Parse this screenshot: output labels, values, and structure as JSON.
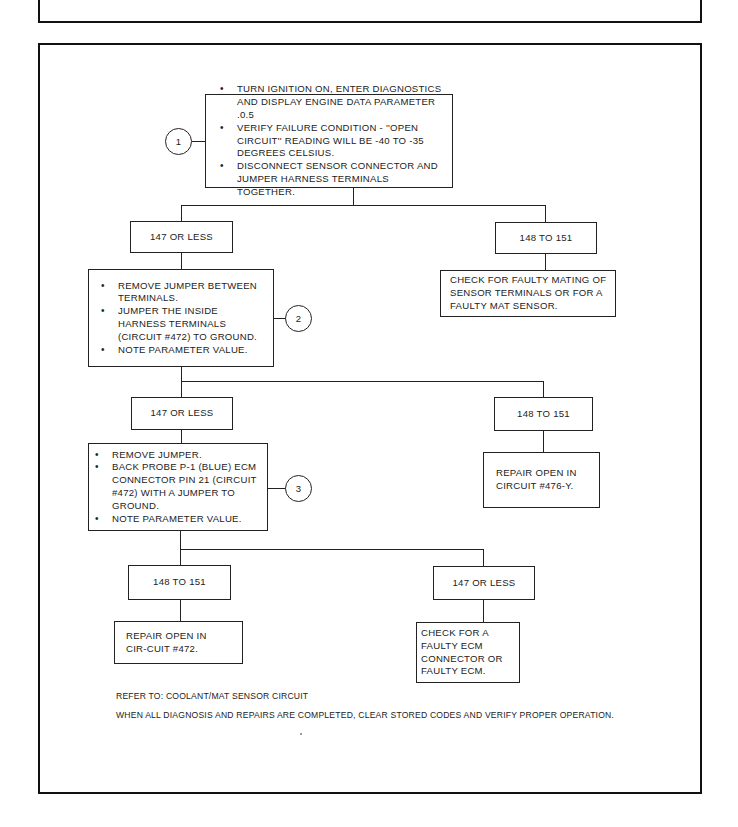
{
  "header": {
    "title": "OPEN MAT SENSOR CIRCUIT"
  },
  "steps": {
    "step1": {
      "number": "1",
      "bullets": [
        "TURN IGNITION ON, ENTER DIAGNOSTICS AND DISPLAY ENGINE DATA PARAMETER .0.5",
        "VERIFY FAILURE CONDITION - ''OPEN CIRCUIT'' READING WILL BE -40 TO -35 DEGREES CELSIUS.",
        "DISCONNECT SENSOR CONNECTOR AND JUMPER HARNESS TERMINALS TOGETHER."
      ]
    },
    "step2": {
      "number": "2",
      "bullets": [
        "REMOVE JUMPER BETWEEN TERMINALS.",
        "JUMPER THE INSIDE HARNESS TERMINALS (CIRCUIT #472) TO GROUND.",
        "NOTE PARAMETER VALUE."
      ]
    },
    "step3": {
      "number": "3",
      "bullets": [
        "REMOVE JUMPER.",
        "BACK PROBE P-1 (BLUE) ECM CONNECTOR PIN 21 (CIRCUIT #472) WITH A JUMPER TO GROUND.",
        "NOTE PARAMETER VALUE."
      ]
    }
  },
  "branches": {
    "b1_left": "147 OR LESS",
    "b1_right": "148 TO 151",
    "b2_left": "147 OR LESS",
    "b2_right": "148 TO 151",
    "b3_left": "148 TO 151",
    "b3_right": "147 OR LESS"
  },
  "results": {
    "r1": "CHECK FOR FAULTY MATING OF SENSOR TERMINALS OR FOR A FAULTY MAT SENSOR.",
    "r2": "REPAIR OPEN IN CIRCUIT #476-Y.",
    "r3": "REPAIR OPEN IN CIR-CUIT #472.",
    "r4": "CHECK FOR A FAULTY ECM CONNECTOR OR FAULTY ECM."
  },
  "notes": {
    "refer": "REFER TO: COOLANT/MAT SENSOR CIRCUIT",
    "completion": "WHEN ALL DIAGNOSIS AND REPAIRS ARE COMPLETED, CLEAR STORED CODES AND VERIFY PROPER OPERATION."
  }
}
